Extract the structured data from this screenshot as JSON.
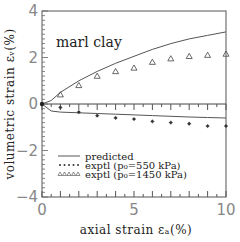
{
  "chart_data": {
    "type": "line",
    "title": "",
    "annotation": "marl clay",
    "xlabel": "axial strain ε_a(%)",
    "ylabel": "volumetric strain ε_v(%)",
    "xlim": [
      0,
      10
    ],
    "ylim": [
      -4,
      4
    ],
    "xticks": [
      "0",
      "5",
      "10"
    ],
    "yticks": [
      "-4",
      "-2",
      "0",
      "2",
      "4"
    ],
    "grid": false,
    "legend_position": "lower-left inside",
    "series": [
      {
        "name": "predicted (p0=1450 kPa)",
        "style": "line",
        "x": [
          0,
          0.5,
          1,
          2,
          3,
          4,
          5,
          6,
          7,
          8,
          9,
          10
        ],
        "y": [
          0,
          0.15,
          0.5,
          1.0,
          1.4,
          1.75,
          2.05,
          2.35,
          2.6,
          2.8,
          2.95,
          3.1
        ]
      },
      {
        "name": "predicted (p0=550 kPa)",
        "style": "line",
        "x": [
          0,
          0.5,
          1,
          2,
          3,
          4,
          5,
          6,
          7,
          8,
          9,
          10
        ],
        "y": [
          0,
          -0.3,
          -0.35,
          -0.38,
          -0.41,
          -0.44,
          -0.47,
          -0.5,
          -0.53,
          -0.56,
          -0.58,
          -0.6
        ]
      },
      {
        "name": "exptl (p0=550 kPa)",
        "style": "star",
        "x": [
          1,
          2,
          3,
          4,
          5,
          6,
          7,
          8,
          9,
          10
        ],
        "y": [
          -0.15,
          -0.35,
          -0.5,
          -0.6,
          -0.65,
          -0.75,
          -0.8,
          -0.85,
          -0.95,
          -0.95
        ]
      },
      {
        "name": "exptl (p0=1450 kPa)",
        "style": "triangle",
        "x": [
          1,
          2,
          3,
          4,
          5,
          6,
          7,
          8,
          9,
          10
        ],
        "y": [
          0.4,
          0.8,
          1.2,
          1.4,
          1.55,
          1.8,
          1.95,
          2.05,
          2.1,
          2.15
        ]
      }
    ],
    "legend": [
      {
        "symbol": "line",
        "label": "predicted"
      },
      {
        "symbol": "star",
        "label": "exptl (p₀=550 kPa)"
      },
      {
        "symbol": "triangle",
        "label": "exptl (p₀=1450 kPa)"
      }
    ]
  }
}
